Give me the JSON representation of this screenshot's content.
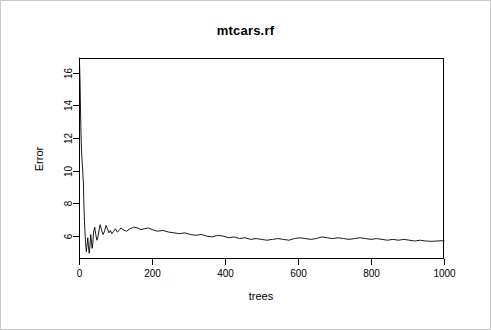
{
  "chart_data": {
    "type": "line",
    "title": "mtcars.rf",
    "xlabel": "trees",
    "ylabel": "Error",
    "xlim": [
      0,
      1000
    ],
    "ylim": [
      4.6,
      16.9
    ],
    "grid": false,
    "legend": null,
    "xticks": [
      0,
      200,
      400,
      600,
      800,
      1000
    ],
    "xtick_labels": [
      "0",
      "200",
      "400",
      "600",
      "800",
      "1000"
    ],
    "yticks": [
      6,
      8,
      10,
      12,
      14,
      16
    ],
    "ytick_labels": [
      "6",
      "8",
      "10",
      "12",
      "14",
      "16"
    ],
    "line_color": "#000000",
    "series": [
      {
        "name": "OOB Error",
        "x": [
          1,
          2,
          3,
          4,
          5,
          6,
          7,
          8,
          9,
          10,
          11,
          12,
          13,
          14,
          15,
          16,
          17,
          18,
          19,
          20,
          22,
          24,
          26,
          28,
          30,
          32,
          34,
          36,
          38,
          40,
          43,
          46,
          49,
          52,
          55,
          58,
          62,
          66,
          70,
          74,
          78,
          82,
          86,
          90,
          95,
          100,
          105,
          110,
          115,
          120,
          130,
          140,
          150,
          160,
          170,
          180,
          190,
          200,
          215,
          230,
          245,
          260,
          275,
          290,
          305,
          320,
          335,
          350,
          365,
          380,
          395,
          410,
          425,
          440,
          455,
          470,
          485,
          500,
          515,
          530,
          545,
          560,
          575,
          590,
          605,
          620,
          635,
          650,
          665,
          680,
          695,
          710,
          725,
          740,
          755,
          770,
          785,
          800,
          815,
          830,
          845,
          860,
          875,
          890,
          905,
          920,
          935,
          950,
          965,
          980,
          995,
          1000
        ],
        "values": [
          16.9,
          16.2,
          15.3,
          13.9,
          12.7,
          11.8,
          11.2,
          10.8,
          10.4,
          10.1,
          9.6,
          9.3,
          8.3,
          7.5,
          6.9,
          6.4,
          6.0,
          5.6,
          5.3,
          5.05,
          5.45,
          5.9,
          5.35,
          4.95,
          5.4,
          6.1,
          5.7,
          5.25,
          5.6,
          6.25,
          6.55,
          6.1,
          5.75,
          5.95,
          6.4,
          6.7,
          6.35,
          6.1,
          6.3,
          6.65,
          6.45,
          6.2,
          6.35,
          6.15,
          6.3,
          6.45,
          6.25,
          6.35,
          6.5,
          6.4,
          6.3,
          6.45,
          6.55,
          6.5,
          6.4,
          6.45,
          6.5,
          6.4,
          6.3,
          6.35,
          6.25,
          6.2,
          6.15,
          6.2,
          6.1,
          6.05,
          6.1,
          6.0,
          5.95,
          6.05,
          6.0,
          5.9,
          5.95,
          5.85,
          5.9,
          5.8,
          5.85,
          5.8,
          5.75,
          5.8,
          5.85,
          5.8,
          5.75,
          5.85,
          5.9,
          5.85,
          5.8,
          5.85,
          5.95,
          5.9,
          5.85,
          5.9,
          5.85,
          5.8,
          5.85,
          5.9,
          5.85,
          5.8,
          5.85,
          5.8,
          5.75,
          5.8,
          5.75,
          5.8,
          5.75,
          5.7,
          5.75,
          5.7,
          5.68,
          5.7,
          5.72,
          5.7
        ]
      }
    ]
  },
  "plot": {
    "frame": {
      "left": 78,
      "right": 443,
      "top": 57,
      "bottom": 258
    },
    "background": "#ffffff",
    "frame_color": "#000000"
  }
}
